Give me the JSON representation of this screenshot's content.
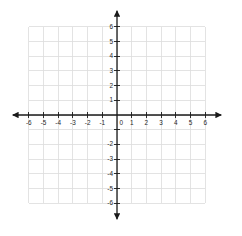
{
  "chart_data": {
    "type": "scatter",
    "title": "",
    "subtitle": "",
    "xlabel": "",
    "ylabel": "",
    "xlim": [
      -6,
      6
    ],
    "ylim": [
      -6,
      6
    ],
    "grid": true,
    "legend": null,
    "series": [],
    "annotations": [],
    "x_tick_values": [
      -6,
      -5,
      -4,
      -3,
      -2,
      -1,
      0,
      1,
      2,
      3,
      4,
      5,
      6
    ],
    "y_tick_values": [
      -6,
      -5,
      -4,
      -3,
      -2,
      -1,
      0,
      1,
      2,
      3,
      4,
      5,
      6
    ],
    "x_tick_labels": [
      "-6",
      "-5",
      "-4",
      "-3",
      "-2",
      "-1",
      "0",
      "1",
      "2",
      "3",
      "4",
      "5",
      "6"
    ],
    "y_tick_labels": [
      "-6",
      "-5",
      "-4",
      "-3",
      "-2",
      "",
      "",
      "1",
      "2",
      "3",
      "4",
      "5",
      "6"
    ],
    "origin_label": "0",
    "grid_step": 1,
    "axis_arrows": [
      "left",
      "right",
      "up",
      "down"
    ]
  },
  "style": {
    "grid_color": "#dcdcdc",
    "axis_color": "#1a1a1a",
    "label_color": "#262626",
    "background": "#ffffff"
  },
  "geometry": {
    "origin_x": 117,
    "origin_y": 115,
    "unit_px": 14.7,
    "grid_min": -6,
    "grid_max": 6,
    "axis_overhang_px": 16,
    "tick_len_px": 3
  }
}
